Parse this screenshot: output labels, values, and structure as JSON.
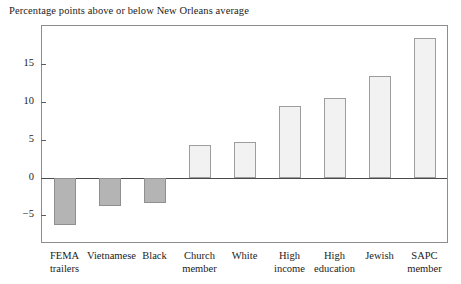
{
  "chart_data": {
    "type": "bar",
    "title": "Percentage points above or below New Orleans average",
    "xlabel": "",
    "ylabel": "",
    "ylim": [
      -8.5,
      20.0
    ],
    "grid": false,
    "legend": null,
    "zero_line": true,
    "categories": [
      "FEMA trailers",
      "Vietnamese",
      "Black",
      "Church member",
      "White",
      "High income",
      "High education",
      "Jewish",
      "SAPC member"
    ],
    "category_lines": [
      [
        "FEMA",
        "trailers"
      ],
      [
        "Vietnamese",
        ""
      ],
      [
        "Black",
        ""
      ],
      [
        "Church",
        "member"
      ],
      [
        "White",
        ""
      ],
      [
        "High",
        "income"
      ],
      [
        "High",
        "education"
      ],
      [
        "Jewish",
        ""
      ],
      [
        "SAPC",
        "member"
      ]
    ],
    "values": [
      -6.3,
      -3.8,
      -3.3,
      4.3,
      4.7,
      9.5,
      10.5,
      13.4,
      18.4
    ],
    "yticks": [
      15,
      10,
      5,
      0,
      -5
    ],
    "ytick_labels": [
      "15",
      "10",
      "5",
      "0",
      "−5"
    ],
    "colors": {
      "positive_fill": "#f2f2f2",
      "negative_fill": "#b4b4b4",
      "bar_border": "#9a9a9a",
      "axis": "#8d8d8d",
      "zero_line": "#4a4a4a",
      "text": "#1b1b1b",
      "background": "#ffffff"
    }
  }
}
